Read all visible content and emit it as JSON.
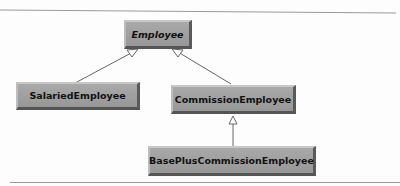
{
  "diagram": {
    "classes": [
      {
        "id": "employee",
        "label": "Employee",
        "abstract": true
      },
      {
        "id": "salaried",
        "label": "SalariedEmployee"
      },
      {
        "id": "commission",
        "label": "CommissionEmployee"
      },
      {
        "id": "baseplus",
        "label": "BasePlusCommissionEmployee"
      }
    ],
    "relations": [
      {
        "from": "salaried",
        "to": "employee",
        "type": "generalization"
      },
      {
        "from": "commission",
        "to": "employee",
        "type": "generalization"
      },
      {
        "from": "baseplus",
        "to": "commission",
        "type": "generalization"
      }
    ]
  }
}
